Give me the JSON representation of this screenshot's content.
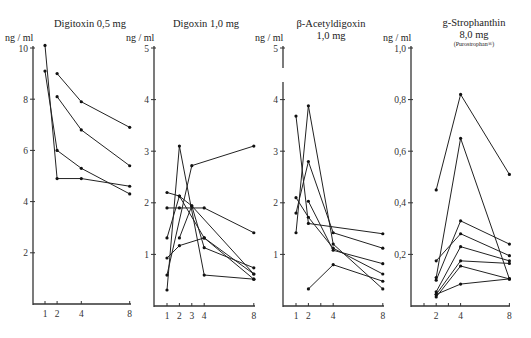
{
  "chart_data": [
    {
      "type": "line",
      "title": "Digitoxin 0,5 mg",
      "ylabel": "ng / ml",
      "xlabel": "",
      "ylim": [
        0,
        10
      ],
      "y_ticks": [
        2,
        4,
        6,
        8,
        10
      ],
      "y_tick_labels": [
        "2",
        "4",
        "6",
        "8",
        "10"
      ],
      "x_ticks": [
        1,
        2,
        4,
        8
      ],
      "x_tick_labels": [
        "1",
        "2",
        "4",
        "8"
      ],
      "grid": false,
      "legend": null,
      "series": [
        {
          "name": "patient 1",
          "points": [
            [
              1,
              10.1
            ],
            [
              2,
              4.9
            ],
            [
              4,
              4.9
            ],
            [
              8,
              4.6
            ]
          ]
        },
        {
          "name": "patient 2",
          "points": [
            [
              1,
              9.1
            ],
            [
              2,
              6.0
            ],
            [
              4,
              5.3
            ],
            [
              8,
              4.3
            ]
          ]
        },
        {
          "name": "patient 3",
          "points": [
            [
              2,
              9.0
            ],
            [
              4,
              7.9
            ],
            [
              8,
              6.9
            ]
          ]
        },
        {
          "name": "patient 4",
          "points": [
            [
              2,
              8.1
            ],
            [
              4,
              6.8
            ],
            [
              8,
              5.4
            ]
          ]
        }
      ]
    },
    {
      "type": "line",
      "title": "Digoxin 1,0 mg",
      "ylabel": "ng / ml",
      "xlabel": "",
      "ylim": [
        0,
        5
      ],
      "y_ticks": [
        1,
        2,
        3,
        4,
        5
      ],
      "y_tick_labels": [
        "1",
        "2",
        "3",
        "4",
        "5"
      ],
      "x_ticks": [
        1,
        2,
        3,
        4,
        8
      ],
      "x_tick_labels": [
        "1",
        "2",
        "3",
        "4",
        "8"
      ],
      "grid": false,
      "legend": null,
      "series": [
        {
          "name": "patient 1",
          "points": [
            [
              1,
              0.31
            ],
            [
              2,
              3.1
            ],
            [
              4,
              0.6
            ],
            [
              8,
              0.52
            ]
          ]
        },
        {
          "name": "patient 2",
          "points": [
            [
              1,
              0.6
            ],
            [
              3,
              2.72
            ],
            [
              8,
              3.1
            ]
          ]
        },
        {
          "name": "patient 3",
          "points": [
            [
              1,
              2.2
            ],
            [
              2,
              2.13
            ],
            [
              4,
              1.32
            ],
            [
              8,
              0.62
            ]
          ]
        },
        {
          "name": "patient 4",
          "points": [
            [
              1,
              1.9
            ],
            [
              2,
              1.9
            ],
            [
              4,
              1.9
            ],
            [
              8,
              1.42
            ]
          ]
        },
        {
          "name": "patient 5",
          "points": [
            [
              1,
              1.32
            ],
            [
              2,
              2.13
            ],
            [
              3,
              1.94
            ],
            [
              4,
              1.13
            ],
            [
              8,
              0.74
            ]
          ]
        },
        {
          "name": "patient 6",
          "points": [
            [
              1,
              0.93
            ],
            [
              2,
              1.17
            ],
            [
              4,
              1.32
            ],
            [
              8,
              0.52
            ]
          ]
        },
        {
          "name": "patient 7",
          "points": [
            [
              2,
              1.32
            ],
            [
              3,
              1.94
            ],
            [
              8,
              0.62
            ]
          ]
        }
      ]
    },
    {
      "type": "line",
      "title": "β-Acetyldigoxin",
      "title_line2": "1,0 mg",
      "ylabel": "ng / ml",
      "xlabel": "",
      "ylim": [
        0,
        5
      ],
      "y_ticks": [
        1,
        2,
        3,
        4,
        5
      ],
      "y_tick_labels": [
        "1",
        "2",
        "3",
        "4",
        "5"
      ],
      "x_ticks": [
        1,
        2,
        3,
        4,
        8
      ],
      "x_tick_labels": [
        "1",
        "2",
        "",
        "4",
        "8"
      ],
      "grid": false,
      "legend": null,
      "series": [
        {
          "name": "patient 1",
          "points": [
            [
              1,
              3.68
            ],
            [
              2,
              1.6
            ],
            [
              8,
              1.4
            ]
          ]
        },
        {
          "name": "patient 2",
          "points": [
            [
              1,
              1.42
            ],
            [
              2,
              3.88
            ],
            [
              4,
              1.2
            ],
            [
              8,
              0.33
            ]
          ]
        },
        {
          "name": "patient 3",
          "points": [
            [
              1,
              2.1
            ],
            [
              2,
              1.72
            ],
            [
              4,
              1.12
            ],
            [
              8,
              0.62
            ]
          ]
        },
        {
          "name": "patient 4",
          "points": [
            [
              1,
              1.8
            ],
            [
              2,
              2.8
            ],
            [
              4,
              1.42
            ],
            [
              8,
              1.12
            ]
          ]
        },
        {
          "name": "patient 5",
          "points": [
            [
              2,
              2.03
            ],
            [
              4,
              1.08
            ],
            [
              8,
              0.82
            ]
          ]
        },
        {
          "name": "patient 6",
          "points": [
            [
              2,
              0.33
            ],
            [
              4,
              0.8
            ],
            [
              8,
              0.48
            ]
          ]
        }
      ]
    },
    {
      "type": "line",
      "title": "g-Strophanthin",
      "title_line2": "8,0 mg",
      "title_line3": "(Purostrophan®)",
      "ylabel": "ng / ml",
      "xlabel": "",
      "ylim": [
        0,
        1.0
      ],
      "y_ticks": [
        0.2,
        0.4,
        0.6,
        0.8,
        1.0
      ],
      "y_tick_labels": [
        "0,2",
        "0,4",
        "0,6",
        "0,8",
        "1,0"
      ],
      "x_ticks": [
        1,
        2,
        3,
        4,
        8
      ],
      "x_tick_labels": [
        "",
        "2",
        "",
        "4",
        "8"
      ],
      "grid": false,
      "legend": null,
      "series": [
        {
          "name": "patient 1",
          "points": [
            [
              2,
              0.45
            ],
            [
              4,
              0.82
            ],
            [
              8,
              0.51
            ]
          ]
        },
        {
          "name": "patient 2",
          "points": [
            [
              2,
              0.11
            ],
            [
              4,
              0.65
            ],
            [
              8,
              0.105
            ]
          ]
        },
        {
          "name": "patient 3",
          "points": [
            [
              2,
              0.175
            ],
            [
              4,
              0.28
            ],
            [
              8,
              0.195
            ]
          ]
        },
        {
          "name": "patient 4",
          "points": [
            [
              2,
              0.1
            ],
            [
              4,
              0.33
            ],
            [
              8,
              0.24
            ]
          ]
        },
        {
          "name": "patient 5",
          "points": [
            [
              2,
              0.055
            ],
            [
              4,
              0.23
            ],
            [
              8,
              0.175
            ]
          ]
        },
        {
          "name": "patient 6",
          "points": [
            [
              2,
              0.045
            ],
            [
              4,
              0.175
            ],
            [
              8,
              0.165
            ]
          ]
        },
        {
          "name": "patient 7",
          "points": [
            [
              2,
              0.035
            ],
            [
              4,
              0.155
            ],
            [
              8,
              0.105
            ]
          ]
        },
        {
          "name": "patient 8",
          "points": [
            [
              2,
              0.045
            ],
            [
              4,
              0.085
            ],
            [
              8,
              0.105
            ]
          ]
        }
      ]
    }
  ],
  "layout": {
    "panels": [
      {
        "axis_x": 33,
        "x0": 45,
        "x_unit": 12.1,
        "x_start": 1,
        "y0": 304,
        "y_top": 48,
        "x_end": 130
      },
      {
        "axis_x": 154,
        "x0": 167,
        "x_unit": 12.4,
        "x_start": 1,
        "y0": 306,
        "y_top": 48,
        "x_end": 254
      },
      {
        "axis_x": 283,
        "x0": 296,
        "x_unit": 12.4,
        "x_start": 1,
        "y0": 306,
        "y_top": 48,
        "x_end": 383
      },
      {
        "axis_x": 411,
        "x0": 424,
        "x_unit": 12.2,
        "x_start": 1,
        "y0": 306,
        "y_top": 48,
        "x_end": 509
      }
    ],
    "title_pos": [
      {
        "x": 90,
        "y": 27
      },
      {
        "x": 206,
        "y": 27
      },
      {
        "x": 331,
        "y": 27
      },
      {
        "x": 474,
        "y": 26
      }
    ]
  }
}
